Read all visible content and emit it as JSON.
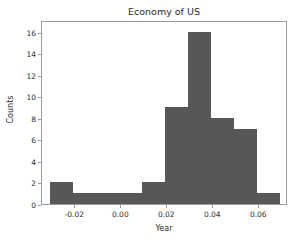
{
  "chart_data": {
    "type": "bar",
    "title": "Economy of US",
    "xlabel": "Year",
    "ylabel": "Counts",
    "grid": false,
    "legend": null,
    "bin_width": 0.01,
    "bin_edges": [
      -0.031,
      -0.021,
      -0.011,
      -0.001,
      0.009,
      0.019,
      0.029,
      0.039,
      0.049,
      0.059,
      0.069
    ],
    "categories": [
      "-0.031",
      "-0.021",
      "-0.011",
      "-0.001",
      "0.009",
      "0.019",
      "0.029",
      "0.039",
      "0.049",
      "0.059"
    ],
    "values": [
      2,
      1,
      1,
      1,
      2,
      9,
      16,
      8,
      7,
      1
    ],
    "bars": [
      {
        "x0": -0.031,
        "x1": -0.021,
        "height": 2
      },
      {
        "x0": -0.021,
        "x1": -0.011,
        "height": 1
      },
      {
        "x0": -0.011,
        "x1": -0.001,
        "height": 1
      },
      {
        "x0": -0.001,
        "x1": 0.009,
        "height": 1
      },
      {
        "x0": 0.009,
        "x1": 0.019,
        "height": 2
      },
      {
        "x0": 0.019,
        "x1": 0.029,
        "height": 9
      },
      {
        "x0": 0.029,
        "x1": 0.039,
        "height": 16
      },
      {
        "x0": 0.039,
        "x1": 0.049,
        "height": 8
      },
      {
        "x0": 0.049,
        "x1": 0.059,
        "height": 7
      },
      {
        "x0": 0.059,
        "x1": 0.069,
        "height": 1
      }
    ],
    "xlim": [
      -0.0345,
      0.0725
    ],
    "ylim": [
      0,
      17.1
    ],
    "xticks": [
      -0.02,
      0.0,
      0.02,
      0.04,
      0.06
    ],
    "xtick_labels": [
      "-0.02",
      "0.00",
      "0.02",
      "0.04",
      "0.06"
    ],
    "yticks": [
      0,
      2,
      4,
      6,
      8,
      10,
      12,
      14,
      16
    ],
    "ytick_labels": [
      "0",
      "2",
      "4",
      "6",
      "8",
      "10",
      "12",
      "14",
      "16"
    ],
    "bar_color": "#575757",
    "frame_color": "#9a9a9a",
    "background_color": "#ffffff"
  }
}
